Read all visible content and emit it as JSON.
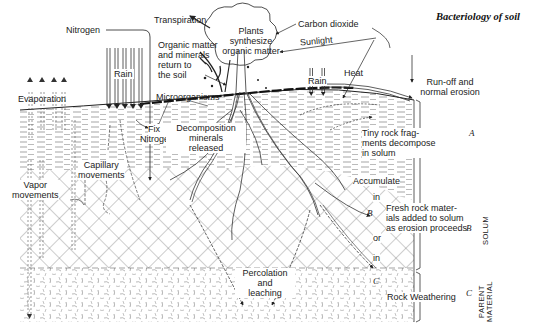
{
  "title": "Bacteriology of soil",
  "labels": {
    "nitrogen_top": "Nitrogen",
    "rain_left": "Rain",
    "evaporation": "Evaporation",
    "transpiration": "Transpiration",
    "plants_line1": "Plants",
    "plants_line2": "synthesize",
    "plants_line3": "organic matter",
    "organic_line1": "Organic matter",
    "organic_line2": "and minerals",
    "organic_line3": "return to",
    "organic_line4": "the soil",
    "carbon_dioxide": "Carbon dioxide",
    "sunlight": "Sunlight",
    "rain_right": "Rain",
    "heat": "Heat",
    "runoff_line1": "Run-off and",
    "runoff_line2": "normal erosion",
    "microorganisms": "Microorganisms",
    "fix_line1": "Fix",
    "fix_line2": "Nitrogen",
    "decomp_line1": "Decomposition",
    "decomp_line2": "minerals",
    "decomp_line3": "released",
    "tiny_line1": "Tiny rock frag-",
    "tiny_line2": "ments decompose",
    "tiny_line3": "in solum",
    "capillary_line1": "Capillary",
    "capillary_line2": "movements",
    "vapor_line1": "Vapor",
    "vapor_line2": "movements",
    "accumulate": "Accumulate",
    "in_1": "in",
    "or": "or",
    "in_2": "in",
    "fresh_line1": "Fresh rock mater-",
    "fresh_line2": "ials added to solum",
    "fresh_line3": "as erosion proceeds",
    "percolation_line1": "Percolation",
    "percolation_line2": "and",
    "percolation_line3": "leaching",
    "rock_weathering": "Rock Weathering"
  },
  "horizons": {
    "a_inner": "A",
    "b_inner": "B",
    "c_inner": "C",
    "a_edge": "A",
    "b_edge": "B",
    "c_edge": "C"
  },
  "side_labels": {
    "solum": "SOLUM",
    "parent_line1": "PARENT",
    "parent_line2": "MATERIAL"
  }
}
